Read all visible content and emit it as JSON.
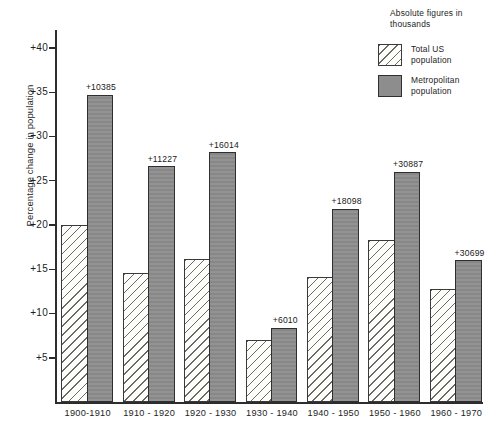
{
  "chart_data": {
    "type": "bar",
    "title": "",
    "xlabel": "",
    "ylabel": "Percentage change in population",
    "ylim": [
      0,
      42
    ],
    "ytick_values": [
      5,
      10,
      15,
      20,
      25,
      30,
      35,
      40
    ],
    "ytick_labels": [
      "+5",
      "+10",
      "+15",
      "+20",
      "+25",
      "+30",
      "+35",
      "+40"
    ],
    "grid": false,
    "legend_position": "top-right",
    "categories": [
      "1900-1910",
      "1910 - 1920",
      "1920 - 1930",
      "1930 - 1940",
      "1940 - 1950",
      "1950 - 1960",
      "1960 - 1970"
    ],
    "series": [
      {
        "name": "Total US population",
        "key": "total",
        "values": [
          20.0,
          14.6,
          16.1,
          7.0,
          14.1,
          18.3,
          12.8
        ]
      },
      {
        "name": "Metropolitan population",
        "key": "metro",
        "values": [
          34.7,
          26.6,
          28.2,
          8.4,
          21.8,
          26.0,
          16.0
        ],
        "data_labels": [
          "+10385",
          "+11227",
          "+16014",
          "+6010",
          "+18098",
          "+30887",
          "+30699"
        ]
      }
    ]
  },
  "legend": {
    "title_line1": "Absolute  figures",
    "title_line2": "in  thousands",
    "entries": [
      {
        "label_line1": "Total US",
        "label_line2": "population",
        "swatch": "hatched-swatch"
      },
      {
        "label_line1": "Metropolitan",
        "label_line2": "population",
        "swatch": "solid-gray-swatch"
      }
    ]
  }
}
